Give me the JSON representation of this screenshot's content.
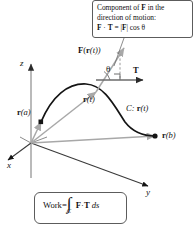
{
  "figure": {
    "type": "vector-field-work-diagram",
    "background": "#ffffff",
    "ink": "#141414",
    "gray": "#a8a8a8"
  },
  "callout": {
    "line1_pre": "Component of ",
    "line1_bold": "F",
    "line1_post": " in the",
    "line2": "direction of motion:",
    "line3_f": "F",
    "line3_dot": " · ",
    "line3_t": "T",
    "line3_eq": " = |",
    "line3_f2": "F",
    "line3_cos": "| cos θ"
  },
  "axes": {
    "z": "z",
    "x": "x",
    "y": "y"
  },
  "labels": {
    "force_vector": {
      "bold": "F",
      "paren_open": "(",
      "r": "r",
      "t": "(t))"
    },
    "tangent": "T",
    "theta": "θ",
    "r_of_t": {
      "bold": "r",
      "arg": "(t)"
    },
    "r_of_a": {
      "bold": "r",
      "arg": "(a)"
    },
    "r_of_b": {
      "bold": "r",
      "arg": "(b)"
    },
    "curve": {
      "c": "C:",
      "bold": "r",
      "arg": "(t)"
    }
  },
  "work": {
    "word": "Work",
    "equals": " = ",
    "integral": "∫",
    "subscript": "C",
    "f": "F",
    "dot": " · ",
    "t": "T",
    "ds": "ds"
  }
}
